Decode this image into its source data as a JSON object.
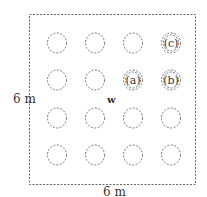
{
  "diagram": {
    "room": {
      "width_label": "6 m",
      "height_label": "6 m"
    },
    "center_label": "w",
    "grid": {
      "rows": 4,
      "cols": 4
    },
    "labeled_circles": [
      {
        "label": "(c)",
        "row": 0,
        "col": 3
      },
      {
        "label": "(a)",
        "row": 1,
        "col": 2
      },
      {
        "label": "(b)",
        "row": 1,
        "col": 3
      }
    ],
    "colors": {
      "stroke": "#666666",
      "text": "#333333"
    }
  }
}
